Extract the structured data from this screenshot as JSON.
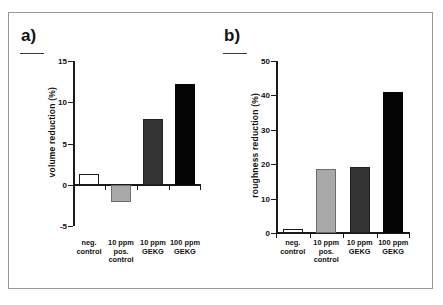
{
  "figure": {
    "panels": [
      {
        "id": "a",
        "label": "a)"
      },
      {
        "id": "b",
        "label": "b)"
      }
    ]
  },
  "chart_data": [
    {
      "type": "bar",
      "panel": "a",
      "title": "a)",
      "xlabel": "",
      "ylabel": "volume reduction (%)",
      "categories": [
        "neg.\ncontrol",
        "10 ppm\npos.\ncontrol",
        "10 ppm\nGEKG",
        "100 ppm\nGEKG"
      ],
      "values": [
        1.3,
        -2.1,
        8.0,
        12.2
      ],
      "bar_colors": [
        "#ffffff",
        "#a9a9a9",
        "#333333",
        "#050505"
      ],
      "ylim": [
        -5,
        15
      ],
      "yticks": [
        15,
        10,
        5,
        0,
        -5
      ],
      "ytick_labels": [
        "15",
        "10",
        "5",
        "0",
        "-5"
      ],
      "grid": false,
      "legend": "none"
    },
    {
      "type": "bar",
      "panel": "b",
      "title": "b)",
      "xlabel": "",
      "ylabel": "roughness reduction (%)",
      "categories": [
        "neg.\ncontrol",
        "10 ppm\npos.\ncontrol",
        "10 ppm\nGEKG",
        "100 ppm\nGEKG"
      ],
      "values": [
        1.1,
        18.7,
        19.3,
        41.0
      ],
      "bar_colors": [
        "#ffffff",
        "#a9a9a9",
        "#333333",
        "#050505"
      ],
      "ylim": [
        0,
        50
      ],
      "yticks": [
        50,
        40,
        30,
        20,
        10,
        0
      ],
      "ytick_labels": [
        "50",
        "40",
        "30",
        "20",
        "10",
        "0"
      ],
      "grid": false,
      "legend": "none"
    }
  ],
  "colors": {
    "frame": "#9a9a9a",
    "axis": "#1a1a1a",
    "text": "#111111"
  }
}
